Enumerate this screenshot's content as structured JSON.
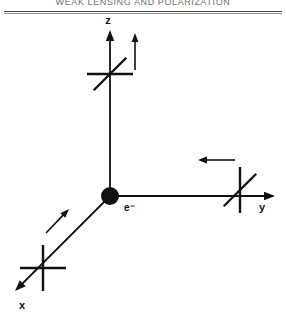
{
  "page": {
    "running_head": "WEAK LENSING AND POLARIZATION",
    "background_color": "#ffffff",
    "ink_color": "#111111"
  },
  "figure": {
    "name": "thomson-scattering-polarization-diagram",
    "origin_label": "e⁻",
    "axes": [
      {
        "id": "z",
        "label": "z",
        "direction": "up",
        "label_x": 108,
        "label_y": 24,
        "line": {
          "x1": 110,
          "y1": 196,
          "x2": 110,
          "y2": 32
        },
        "arrowhead": {
          "x": 110,
          "y": 30,
          "angle_deg": -90
        }
      },
      {
        "id": "y",
        "label": "y",
        "direction": "right",
        "label_x": 262,
        "label_y": 211,
        "line": {
          "x1": 110,
          "y1": 196,
          "x2": 273,
          "y2": 196
        },
        "arrowhead": {
          "x": 275,
          "y": 196,
          "angle_deg": 0
        }
      },
      {
        "id": "x",
        "label": "x",
        "direction": "down-left",
        "label_x": 22,
        "label_y": 309,
        "line": {
          "x1": 110,
          "y1": 196,
          "x2": 19,
          "y2": 287
        },
        "arrowhead": {
          "x": 15,
          "y": 291,
          "angle_deg": 135
        }
      }
    ],
    "polarization_crosses": [
      {
        "id": "cross-on-z",
        "cx": 110,
        "cy": 74,
        "arms": [
          "horizontal",
          "diagonal-45"
        ]
      },
      {
        "id": "cross-on-y",
        "cx": 240,
        "cy": 190,
        "arms": [
          "vertical",
          "diagonal-45"
        ]
      },
      {
        "id": "cross-on-x",
        "cx": 43,
        "cy": 268,
        "arms": [
          "vertical",
          "horizontal"
        ]
      }
    ],
    "field_arrows": [
      {
        "id": "arrow-near-z",
        "x1": 135,
        "y1": 70,
        "x2": 135,
        "y2": 33,
        "direction": "up"
      },
      {
        "id": "arrow-near-y",
        "x1": 235,
        "y1": 160,
        "x2": 198,
        "y2": 160,
        "direction": "left"
      },
      {
        "id": "arrow-near-x",
        "x1": 46,
        "y1": 233,
        "x2": 69,
        "y2": 209,
        "direction": "up-right"
      }
    ],
    "origin_dot": {
      "cx": 110,
      "cy": 196,
      "r": 9
    },
    "origin_label_pos": {
      "x": 124,
      "y": 211
    }
  }
}
